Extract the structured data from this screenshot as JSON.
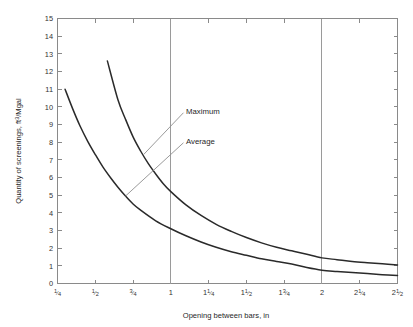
{
  "chart_data": {
    "type": "line",
    "title": "",
    "xlabel": "Opening between bars, in",
    "ylabel": "Quantity of screenings, ft³/Mgal",
    "xlim": [
      0.25,
      2.5
    ],
    "ylim": [
      0,
      15
    ],
    "grid": false,
    "legend_position": "inline-annotations",
    "x_tick_labels": [
      "¼",
      "½",
      "¾",
      "1",
      "1¼",
      "1½",
      "1¾",
      "2",
      "2¼",
      "2½"
    ],
    "x_tick_values": [
      0.25,
      0.5,
      0.75,
      1.0,
      1.25,
      1.5,
      1.75,
      2.0,
      2.25,
      2.5
    ],
    "y_tick_labels": [
      "0",
      "1",
      "2",
      "3",
      "4",
      "5",
      "6",
      "7",
      "8",
      "9",
      "10",
      "11",
      "12",
      "13",
      "14",
      "15"
    ],
    "y_tick_values": [
      0,
      1,
      2,
      3,
      4,
      5,
      6,
      7,
      8,
      9,
      10,
      11,
      12,
      13,
      14,
      15
    ],
    "reference_lines": [
      {
        "axis": "x",
        "value": 1.0,
        "label": "1"
      },
      {
        "axis": "x",
        "value": 2.0,
        "label": "2"
      }
    ],
    "series": [
      {
        "name": "Maximum",
        "color": "#2a2a2a",
        "x": [
          0.58,
          0.65,
          0.7,
          0.75,
          0.8,
          0.85,
          0.9,
          0.95,
          1.0,
          1.1,
          1.2,
          1.3,
          1.4,
          1.5,
          1.6,
          1.7,
          1.8,
          1.9,
          2.0,
          2.1,
          2.2,
          2.3,
          2.4,
          2.5
        ],
        "y": [
          12.6,
          10.4,
          9.3,
          8.3,
          7.5,
          6.8,
          6.2,
          5.65,
          5.2,
          4.45,
          3.85,
          3.35,
          2.95,
          2.6,
          2.3,
          2.05,
          1.85,
          1.65,
          1.45,
          1.35,
          1.25,
          1.18,
          1.12,
          1.05
        ]
      },
      {
        "name": "Average",
        "color": "#2a2a2a",
        "x": [
          0.3,
          0.35,
          0.4,
          0.45,
          0.5,
          0.55,
          0.6,
          0.65,
          0.7,
          0.75,
          0.8,
          0.9,
          1.0,
          1.1,
          1.2,
          1.3,
          1.4,
          1.5,
          1.6,
          1.7,
          1.8,
          1.9,
          2.0,
          2.1,
          2.2,
          2.3,
          2.4,
          2.5
        ],
        "y": [
          11.0,
          9.9,
          8.9,
          8.05,
          7.3,
          6.6,
          6.0,
          5.45,
          4.95,
          4.5,
          4.15,
          3.55,
          3.1,
          2.7,
          2.35,
          2.05,
          1.8,
          1.6,
          1.4,
          1.25,
          1.1,
          0.9,
          0.75,
          0.68,
          0.62,
          0.56,
          0.5,
          0.45
        ]
      }
    ],
    "annotations": [
      {
        "text": "Maximum",
        "label_x": 1.1,
        "label_y": 9.75,
        "anchor_x": 0.82,
        "anchor_y": 7.3
      },
      {
        "text": "Average",
        "label_x": 1.1,
        "label_y": 8.05,
        "anchor_x": 0.7,
        "anchor_y": 4.95
      }
    ],
    "colors": {
      "curve": "#2a2a2a",
      "axis": "#8a8a8a",
      "reference_line": "#9a9a9a",
      "leader_line": "#8e8e8e",
      "text": "#1f1f1f",
      "background": "#ffffff"
    }
  }
}
